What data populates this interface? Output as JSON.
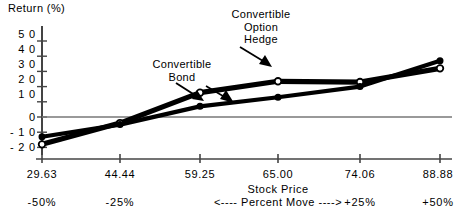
{
  "chart_data": {
    "type": "line",
    "title": "",
    "ylabel": "Return  (%)",
    "xlabel": "Stock Price",
    "x_secondary_label": "<---- Percent Move ---->",
    "grid": false,
    "legend_position": "annotations",
    "ylim": [
      -20,
      50
    ],
    "yticks": [
      50,
      40,
      30,
      20,
      10,
      0,
      -10,
      -20
    ],
    "ytick_labels": [
      "5 0",
      "4 0",
      "3 0",
      "2 0",
      "1 0",
      "0",
      "- 1 0",
      "- 2 0"
    ],
    "categories": [
      "29.63",
      "44.44",
      "59.25",
      "65.00",
      "74.06",
      "88.88"
    ],
    "x_values": [
      29.63,
      44.44,
      59.25,
      65.0,
      74.06,
      88.88
    ],
    "percent_move_labels": [
      "-50%",
      "-25%",
      "",
      "",
      "+25%",
      "+50%"
    ],
    "zero_line": 0,
    "series": [
      {
        "name": "Convertible Option Hedge",
        "marker": "open-circle",
        "values": [
          -18,
          -4,
          16,
          23.5,
          23,
          32
        ]
      },
      {
        "name": "Convertible Bond",
        "marker": "filled-dot",
        "values": [
          -13,
          -5,
          7,
          13,
          20,
          37
        ]
      }
    ],
    "annotations": [
      {
        "text_lines": [
          "Convertible",
          "Bond"
        ],
        "points_to_series": "Convertible Bond"
      },
      {
        "text_lines": [
          "Convertible",
          "Option",
          "Hedge"
        ],
        "points_to_series": "Convertible Option Hedge"
      }
    ]
  },
  "labels": {
    "y_axis_title": "Return  (%)",
    "x_axis_title": "Stock Price",
    "percent_move": "<---- Percent Move ---->",
    "ann_bond_1": "Convertible",
    "ann_bond_2": "Bond",
    "ann_hedge_1": "Convertible",
    "ann_hedge_2": "Option",
    "ann_hedge_3": "Hedge",
    "y0": "5 0",
    "y1": "4 0",
    "y2": "3 0",
    "y3": "2 0",
    "y4": "1 0",
    "y5": "0",
    "y6": "- 1 0",
    "y7": "- 2 0",
    "x0": "29.63",
    "x1": "44.44",
    "x2": "59.25",
    "x3": "65.00",
    "x4": "74.06",
    "x5": "88.88",
    "p0": "-50%",
    "p1": "-25%",
    "p4": "+25%",
    "p5": "+50%"
  }
}
